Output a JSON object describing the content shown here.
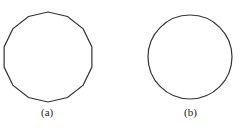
{
  "figures": [
    {
      "label": "(a)",
      "shape": "polygon",
      "sides": 14,
      "center": [
        48,
        57
      ],
      "radius": 45
    },
    {
      "label": "(b)",
      "shape": "circle",
      "center": [
        190,
        57
      ],
      "radius": 42
    }
  ],
  "colors": {
    "stroke": "#333333",
    "background": "#ffffff"
  }
}
